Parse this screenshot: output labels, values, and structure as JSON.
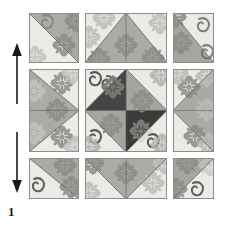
{
  "figure": {
    "label": "1",
    "caption_text": "1"
  },
  "arrows": [
    {
      "name": "up-arrow",
      "direction": "up",
      "x": 16,
      "y_top": 44,
      "y_bottom": 104
    },
    {
      "name": "down-arrow",
      "direction": "down",
      "x": 16,
      "y_top": 132,
      "y_bottom": 192
    }
  ],
  "colors": {
    "background": "#ffffff",
    "light_fabric": "#e9e7e2",
    "light_fabric_alt": "#dedcd6",
    "medium_gray": "#a8a8a4",
    "medium_gray_alt": "#9b9b97",
    "dark_gray": "#4a4a4a",
    "dark_gray_alt": "#3d3d3d",
    "seam_line": "#6e6e6e",
    "block_border": "#8d8d8d",
    "motif_gray": "#8b8b87",
    "motif_light": "#c9c7c2",
    "arrow_color": "#1a1a1a",
    "label_color": "#1a1a1a"
  },
  "layout": {
    "grid_origin_x": 29,
    "grid_origin_y": 13,
    "grid_width": 185,
    "grid_height": 186,
    "columns": 3,
    "rows": 3,
    "gutter": 6
  },
  "quilt": {
    "title": "Nine-patch quilt block layout",
    "blocks": [
      {
        "name": "block-top-left",
        "row": 0,
        "col": 0,
        "type": "half-square-triangle",
        "orientation": "diagonal-tl-br",
        "light_position": "upper-left",
        "dark_position": "lower-right"
      },
      {
        "name": "block-top-center",
        "row": 0,
        "col": 1,
        "type": "flying-geese",
        "orientation": "point-up",
        "light_position": "corners",
        "dark_position": "center"
      },
      {
        "name": "block-top-right",
        "row": 0,
        "col": 2,
        "type": "half-square-triangle",
        "orientation": "diagonal-bl-tr",
        "light_position": "upper-right",
        "dark_position": "lower-left"
      },
      {
        "name": "block-middle-left",
        "row": 1,
        "col": 0,
        "type": "flying-geese",
        "orientation": "point-right",
        "light_position": "corners",
        "dark_position": "center"
      },
      {
        "name": "block-center",
        "row": 1,
        "col": 1,
        "type": "square-in-a-square",
        "orientation": "diamond",
        "light_position": "corners",
        "dark_position": "center-quarters"
      },
      {
        "name": "block-middle-right",
        "row": 1,
        "col": 2,
        "type": "flying-geese",
        "orientation": "point-left",
        "light_position": "corners",
        "dark_position": "center"
      },
      {
        "name": "block-bottom-left",
        "row": 2,
        "col": 0,
        "type": "half-square-triangle",
        "orientation": "diagonal-bl-tr",
        "light_position": "lower-left",
        "dark_position": "upper-right"
      },
      {
        "name": "block-bottom-center",
        "row": 2,
        "col": 1,
        "type": "flying-geese",
        "orientation": "point-down",
        "light_position": "corners",
        "dark_position": "center"
      },
      {
        "name": "block-bottom-right",
        "row": 2,
        "col": 2,
        "type": "half-square-triangle",
        "orientation": "diagonal-tl-br",
        "light_position": "lower-right",
        "dark_position": "upper-left"
      }
    ]
  }
}
